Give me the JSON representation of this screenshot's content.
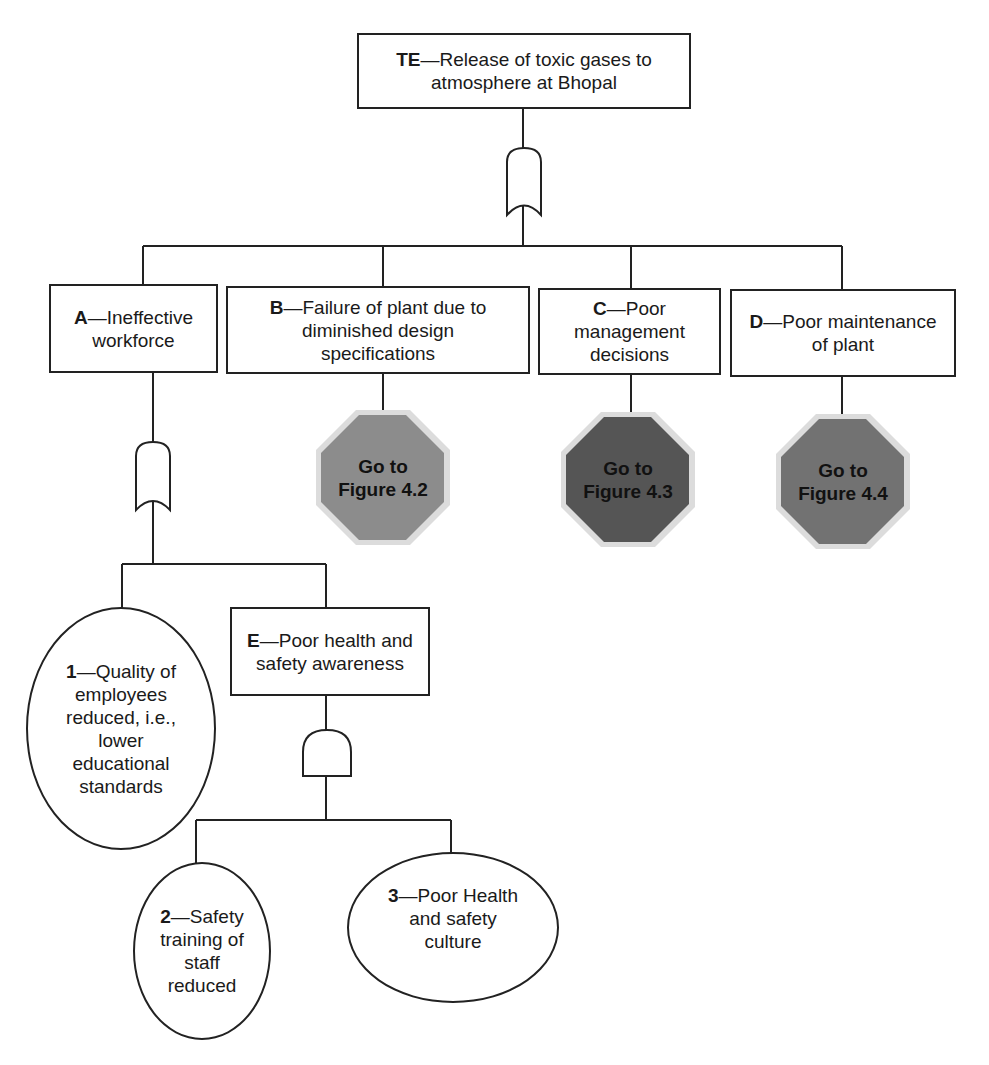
{
  "diagram": {
    "type": "fault-tree",
    "top_event": {
      "code": "TE",
      "text": "—Release of toxic gases to atmosphere at Bhopal",
      "line1": "—Release of toxic gases to",
      "line2": "atmosphere at Bhopal"
    },
    "top_gate": "OR",
    "intermediate_events": [
      {
        "code": "A",
        "text": "—Ineffective workforce",
        "gate": "OR"
      },
      {
        "code": "B",
        "text": "—Failure of plant due to diminished design specifications",
        "transfer": "Go to Figure 4.2"
      },
      {
        "code": "C",
        "text": "—Poor management decisions",
        "transfer": "Go to Figure 4.3"
      },
      {
        "code": "D",
        "text": "—Poor maintenance of plant",
        "transfer": "Go to Figure 4.4"
      },
      {
        "code": "E",
        "text": "—Poor health and safety awareness",
        "gate": "AND"
      }
    ],
    "basic_events": [
      {
        "code": "1",
        "text": "—Quality of employees reduced, i.e., lower educational standards"
      },
      {
        "code": "2",
        "text": "—Safety training of staff reduced"
      },
      {
        "code": "3",
        "text": "—Poor Health and safety culture"
      }
    ],
    "transfers": [
      {
        "line1": "Go to",
        "line2": "Figure 4.2",
        "color": "#8c8c8c"
      },
      {
        "line1": "Go to",
        "line2": "Figure 4.3",
        "color": "#555555"
      },
      {
        "line1": "Go to",
        "line2": "Figure 4.4",
        "color": "#727272"
      }
    ]
  }
}
